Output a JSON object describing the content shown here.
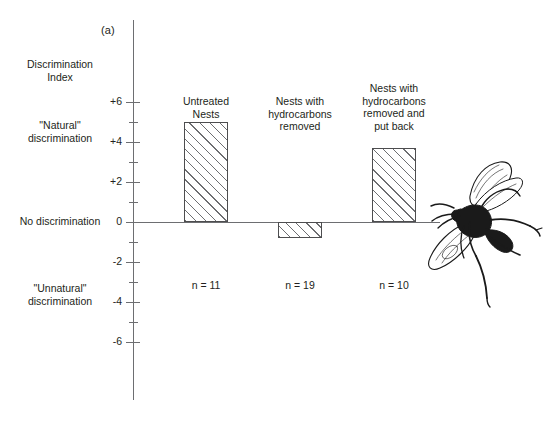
{
  "figure": {
    "panel_label": "(a)",
    "axis_title": "Discrimination\nIndex"
  },
  "annotations": {
    "natural": "\"Natural\"\ndiscrimination",
    "zero": "No discrimination",
    "unnatural": "\"Unnatural\"\ndiscrimination"
  },
  "chart_data": {
    "type": "bar",
    "title": "",
    "xlabel": "",
    "ylabel": "Discrimination Index",
    "ylim": [
      -6,
      6
    ],
    "yticks": [
      6,
      4,
      2,
      0,
      -2,
      -4,
      -6
    ],
    "ytick_labels": [
      "+6",
      "+4",
      "+2",
      "0",
      "-2",
      "-4",
      "-6"
    ],
    "minor_yticks": [
      5,
      3,
      1,
      -1,
      -3,
      -5
    ],
    "grid": false,
    "legend": "none",
    "zero_reference_line": true,
    "categories": [
      "Untreated\nNests",
      "Nests with\nhydrocarbons\nremoved",
      "Nests with\nhydrocarbons\nremoved and\nput back"
    ],
    "values": [
      5.0,
      -0.8,
      3.7
    ],
    "sample_sizes": [
      "n = 11",
      "n = 19",
      "n = 10"
    ],
    "bar_fill": "diagonal-hatch",
    "bar_edge_color": "#4d4d4f"
  },
  "ticks": [
    {
      "label": "+6",
      "value": 6,
      "major": true
    },
    {
      "label": "",
      "value": 5,
      "major": false
    },
    {
      "label": "+4",
      "value": 4,
      "major": true
    },
    {
      "label": "",
      "value": 3,
      "major": false
    },
    {
      "label": "+2",
      "value": 2,
      "major": true
    },
    {
      "label": "",
      "value": 1,
      "major": false
    },
    {
      "label": "0",
      "value": 0,
      "major": true
    },
    {
      "label": "",
      "value": -1,
      "major": false
    },
    {
      "label": "-2",
      "value": -2,
      "major": true
    },
    {
      "label": "",
      "value": -3,
      "major": false
    },
    {
      "label": "-4",
      "value": -4,
      "major": true
    },
    {
      "label": "",
      "value": -5,
      "major": false
    },
    {
      "label": "-6",
      "value": -6,
      "major": true
    }
  ],
  "illustration": {
    "name": "wasp-illustration",
    "subject": "wasp"
  }
}
